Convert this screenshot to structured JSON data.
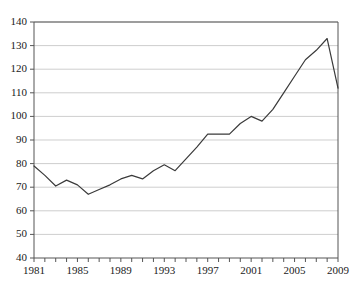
{
  "chart_data": {
    "type": "line",
    "title": "",
    "subtitle": "",
    "xlabel": "",
    "ylabel": "",
    "xlim": [
      1981,
      2009
    ],
    "ylim": [
      40,
      140
    ],
    "grid": true,
    "legend": "none",
    "y_ticks": [
      40,
      50,
      60,
      70,
      80,
      90,
      100,
      110,
      120,
      130,
      140
    ],
    "y_tick_labels": [
      "40",
      "50",
      "60",
      "70",
      "80",
      "90",
      "100",
      "110",
      "120",
      "130",
      "140"
    ],
    "x_ticks": [
      1981,
      1982,
      1983,
      1984,
      1985,
      1986,
      1987,
      1988,
      1989,
      1990,
      1991,
      1992,
      1993,
      1994,
      1995,
      1996,
      1997,
      1998,
      1999,
      2000,
      2001,
      2002,
      2003,
      2004,
      2005,
      2006,
      2007,
      2008,
      2009
    ],
    "x_tick_labels": [
      "1981",
      "",
      "",
      "",
      "1985",
      "",
      "",
      "",
      "1989",
      "",
      "",
      "",
      "1993",
      "",
      "",
      "",
      "1997",
      "",
      "",
      "",
      "2001",
      "",
      "",
      "",
      "2005",
      "",
      "",
      "",
      "2009"
    ],
    "x_labeled_years": [
      1981,
      1985,
      1989,
      1993,
      1997,
      2001,
      2005,
      2009
    ],
    "series": [
      {
        "name": "series-1",
        "color": "#3a3a3a",
        "x": [
          1981,
          1982,
          1983,
          1984,
          1985,
          1986,
          1987,
          1988,
          1989,
          1990,
          1991,
          1992,
          1993,
          1994,
          1995,
          1996,
          1997,
          1998,
          1999,
          2000,
          2001,
          2002,
          2003,
          2004,
          2005,
          2006,
          2007,
          2008,
          2009
        ],
        "values": [
          79,
          75,
          70.5,
          73,
          71,
          67,
          69,
          71,
          73.5,
          75,
          73.5,
          77,
          79.5,
          77,
          82,
          87,
          92.5,
          92.5,
          92.5,
          97,
          100,
          98,
          103,
          110,
          117,
          124,
          128,
          133,
          112
        ]
      }
    ]
  },
  "colors": {
    "axis": "#555555",
    "grid": "#b9b9b9",
    "line": "#3a3a3a",
    "background": "#ffffff",
    "text": "#1a1a1a"
  }
}
